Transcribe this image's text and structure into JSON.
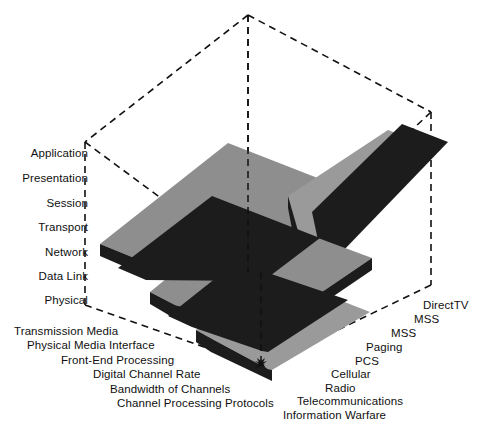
{
  "diagram": {
    "type": "3d-layered-block-diagram",
    "colors": {
      "slab_top_light": "#9b9b9b",
      "slab_top_mid": "#8a8a8a",
      "slab_edge_dark": "#1c1c1c",
      "wireframe": "#111111",
      "background": "#ffffff",
      "text": "#101010"
    },
    "vertical_axis": {
      "name": "osi-layers",
      "labels": [
        {
          "text": "Application",
          "x": 88,
          "y": 154
        },
        {
          "text": "Presentation",
          "x": 88,
          "y": 179
        },
        {
          "text": "Session",
          "x": 88,
          "y": 204
        },
        {
          "text": "Transport",
          "x": 88,
          "y": 229
        },
        {
          "text": "Network",
          "x": 88,
          "y": 253
        },
        {
          "text": "Data Link",
          "x": 88,
          "y": 277
        },
        {
          "text": "Physical",
          "x": 88,
          "y": 300
        }
      ]
    },
    "left_axis": {
      "name": "transmission-attributes",
      "labels": [
        {
          "text": "Transmission Media",
          "x": 14,
          "y": 331
        },
        {
          "text": "Physical Media Interface",
          "x": 27,
          "y": 345
        },
        {
          "text": "Front-End Processing",
          "x": 61,
          "y": 360
        },
        {
          "text": "Digital Channel Rate",
          "x": 93,
          "y": 374
        },
        {
          "text": "Bandwidth of Channels",
          "x": 110,
          "y": 389
        },
        {
          "text": "Channel Processing Protocols",
          "x": 117,
          "y": 403
        }
      ]
    },
    "right_axis": {
      "name": "telecom-services",
      "labels": [
        {
          "text": "DirectTV",
          "x": 423,
          "y": 305
        },
        {
          "text": "MSS",
          "x": 414,
          "y": 319
        },
        {
          "text": "MSS",
          "x": 391,
          "y": 333
        },
        {
          "text": "Paging",
          "x": 366,
          "y": 347
        },
        {
          "text": "PCS",
          "x": 355,
          "y": 361
        },
        {
          "text": "Cellular",
          "x": 331,
          "y": 374
        },
        {
          "text": "Radio",
          "x": 325,
          "y": 388
        },
        {
          "text": "Telecommunications",
          "x": 297,
          "y": 401
        },
        {
          "text": "Information Warfare",
          "x": 283,
          "y": 415
        }
      ]
    },
    "wireframe_box": {
      "apex_top": [
        248,
        15
      ],
      "corner_left": [
        85,
        142
      ],
      "corner_right": [
        431,
        112
      ],
      "corner_front": [
        261,
        367
      ],
      "left_bottom": [
        85,
        305
      ],
      "right_bottom": [
        431,
        285
      ]
    },
    "slabs": {
      "count": 7,
      "description": "Chevron-folded layer slabs, alternating light-gray top faces with dark side edges, stacked from top-back to bottom-front"
    }
  }
}
